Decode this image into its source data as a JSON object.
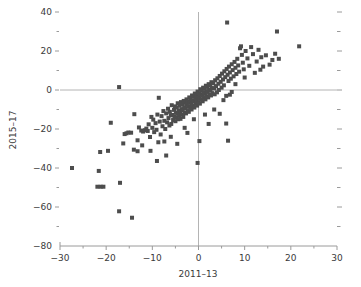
{
  "chart_data": {
    "type": "scatter",
    "title": "",
    "xlabel": "2011–13",
    "ylabel": "2015–17",
    "xlim": [
      -30,
      30
    ],
    "ylim": [
      -80,
      40
    ],
    "x_major_ticks": [
      -30,
      -20,
      -10,
      0,
      10,
      20,
      30
    ],
    "y_major_ticks": [
      40,
      20,
      0,
      -20,
      -40,
      -60,
      -80
    ],
    "x_tick_labels": [
      "−30",
      "−20",
      "−10",
      "0",
      "10",
      "20",
      "30"
    ],
    "y_tick_labels": [
      "40",
      "20",
      "0",
      "−20",
      "−40",
      "−60",
      "−80"
    ],
    "x_minor_ticks": [
      -25,
      -15,
      -5,
      5,
      15,
      25
    ],
    "y_minor_ticks": [
      30,
      10,
      -10,
      -30,
      -50,
      -70
    ],
    "grid": false,
    "zero_lines": true,
    "legend": null,
    "marker": "square",
    "marker_size_px": 4,
    "marker_color": "#4d4d4d",
    "axis_color": "#9a9a9a",
    "zero_line_color": "#b4b4b4",
    "text_color": "#3a3a3a",
    "n_points": 208,
    "points": [
      [
        -27.4,
        -40.0
      ],
      [
        -21.6,
        -41.5
      ],
      [
        -21.9,
        -49.6
      ],
      [
        -21.2,
        -49.6
      ],
      [
        -20.6,
        -49.6
      ],
      [
        -19.0,
        -16.8
      ],
      [
        -21.3,
        -31.8
      ],
      [
        -19.6,
        -31.2
      ],
      [
        -17.2,
        -62.2
      ],
      [
        -17.0,
        -47.6
      ],
      [
        -17.2,
        1.5
      ],
      [
        -16.3,
        -27.4
      ],
      [
        -16.0,
        -22.6
      ],
      [
        -15.6,
        -22.2
      ],
      [
        -15.2,
        -21.8
      ],
      [
        -14.6,
        -21.9
      ],
      [
        -14.4,
        -65.5
      ],
      [
        -14.0,
        -30.6
      ],
      [
        -13.9,
        -12.4
      ],
      [
        -13.2,
        -25.8
      ],
      [
        -12.9,
        -19.2
      ],
      [
        -12.4,
        -20.8
      ],
      [
        -12.0,
        -21.3
      ],
      [
        -11.6,
        -20.6
      ],
      [
        -11.3,
        -19.8
      ],
      [
        -11.0,
        -21.0
      ],
      [
        -10.8,
        -17.6
      ],
      [
        -10.5,
        -24.1
      ],
      [
        -10.4,
        -31.2
      ],
      [
        -10.2,
        -13.8
      ],
      [
        -10.0,
        -19.4
      ],
      [
        -9.8,
        -15.2
      ],
      [
        -9.6,
        -21.6
      ],
      [
        -9.3,
        -17.0
      ],
      [
        -9.1,
        -20.4
      ],
      [
        -8.9,
        -12.6
      ],
      [
        -8.7,
        -26.8
      ],
      [
        -8.6,
        -4.0
      ],
      [
        -8.4,
        -16.2
      ],
      [
        -8.2,
        -22.8
      ],
      [
        -8.0,
        -13.4
      ],
      [
        -7.8,
        -18.6
      ],
      [
        -7.6,
        -10.8
      ],
      [
        -7.4,
        -15.8
      ],
      [
        -7.2,
        -20.0
      ],
      [
        -7.0,
        -12.0
      ],
      [
        -7.0,
        -33.6
      ],
      [
        -6.8,
        -16.6
      ],
      [
        -6.6,
        -9.6
      ],
      [
        -6.5,
        -14.4
      ],
      [
        -6.3,
        -18.2
      ],
      [
        -6.2,
        -11.2
      ],
      [
        -6.0,
        -13.0
      ],
      [
        -5.9,
        -17.4
      ],
      [
        -5.8,
        -7.8
      ],
      [
        -5.6,
        -12.8
      ],
      [
        -5.5,
        -15.4
      ],
      [
        -5.3,
        -10.2
      ],
      [
        -5.2,
        -13.6
      ],
      [
        -5.1,
        -8.4
      ],
      [
        -5.0,
        -16.0
      ],
      [
        -4.9,
        -11.6
      ],
      [
        -4.8,
        -14.2
      ],
      [
        -4.7,
        -9.0
      ],
      [
        -4.6,
        -12.2
      ],
      [
        -4.5,
        -6.8
      ],
      [
        -4.4,
        -15.0
      ],
      [
        -4.3,
        -10.6
      ],
      [
        -4.2,
        -13.2
      ],
      [
        -4.1,
        -8.0
      ],
      [
        -4.0,
        -11.4
      ],
      [
        -3.9,
        -14.8
      ],
      [
        -3.8,
        -6.2
      ],
      [
        -3.7,
        -9.8
      ],
      [
        -3.6,
        -12.6
      ],
      [
        -3.5,
        -7.4
      ],
      [
        -3.4,
        -10.4
      ],
      [
        -3.3,
        -13.8
      ],
      [
        -3.2,
        -5.6
      ],
      [
        -3.1,
        -8.8
      ],
      [
        -3.0,
        -11.8
      ],
      [
        -2.9,
        -6.6
      ],
      [
        -2.8,
        -9.4
      ],
      [
        -2.7,
        -12.0
      ],
      [
        -2.6,
        -4.8
      ],
      [
        -2.5,
        -7.6
      ],
      [
        -2.4,
        -10.8
      ],
      [
        -2.3,
        -5.8
      ],
      [
        -2.2,
        -8.6
      ],
      [
        -2.1,
        -11.2
      ],
      [
        -2.0,
        -3.8
      ],
      [
        -1.9,
        -6.4
      ],
      [
        -1.8,
        -9.2
      ],
      [
        -1.7,
        -4.6
      ],
      [
        -1.6,
        -7.2
      ],
      [
        -1.5,
        -10.0
      ],
      [
        -1.4,
        -2.8
      ],
      [
        -1.3,
        -5.4
      ],
      [
        -1.2,
        -8.2
      ],
      [
        -1.1,
        -3.4
      ],
      [
        -1.0,
        -6.0
      ],
      [
        -0.9,
        -9.0
      ],
      [
        -0.8,
        -1.8
      ],
      [
        -0.7,
        -4.4
      ],
      [
        -0.6,
        -7.0
      ],
      [
        -0.5,
        -2.6
      ],
      [
        -0.4,
        -5.2
      ],
      [
        -0.3,
        -8.0
      ],
      [
        -0.2,
        -0.8
      ],
      [
        -0.1,
        -3.6
      ],
      [
        0.0,
        -6.2
      ],
      [
        0.1,
        -1.6
      ],
      [
        0.2,
        -4.2
      ],
      [
        0.3,
        -7.0
      ],
      [
        0.4,
        0.4
      ],
      [
        0.5,
        -2.4
      ],
      [
        0.6,
        -5.0
      ],
      [
        0.7,
        -0.4
      ],
      [
        0.8,
        -3.0
      ],
      [
        0.9,
        -5.8
      ],
      [
        1.0,
        1.2
      ],
      [
        1.1,
        -1.4
      ],
      [
        1.2,
        -4.0
      ],
      [
        1.3,
        0.6
      ],
      [
        1.4,
        -2.0
      ],
      [
        1.5,
        -4.8
      ],
      [
        1.6,
        2.2
      ],
      [
        1.7,
        -0.6
      ],
      [
        1.8,
        -3.2
      ],
      [
        1.9,
        1.6
      ],
      [
        2.0,
        -1.0
      ],
      [
        2.1,
        -3.8
      ],
      [
        2.2,
        3.0
      ],
      [
        2.3,
        0.2
      ],
      [
        2.4,
        -2.4
      ],
      [
        2.5,
        2.4
      ],
      [
        2.6,
        -0.2
      ],
      [
        2.7,
        -2.8
      ],
      [
        2.8,
        4.0
      ],
      [
        2.9,
        1.0
      ],
      [
        3.0,
        -1.6
      ],
      [
        3.2,
        3.4
      ],
      [
        3.4,
        0.8
      ],
      [
        3.5,
        -2.2
      ],
      [
        3.6,
        5.0
      ],
      [
        3.8,
        2.0
      ],
      [
        4.0,
        -1.2
      ],
      [
        4.1,
        6.0
      ],
      [
        4.3,
        3.2
      ],
      [
        4.4,
        0.0
      ],
      [
        4.6,
        7.2
      ],
      [
        4.8,
        4.2
      ],
      [
        5.0,
        1.2
      ],
      [
        5.1,
        8.4
      ],
      [
        5.3,
        5.4
      ],
      [
        5.5,
        2.4
      ],
      [
        5.6,
        9.6
      ],
      [
        5.8,
        6.6
      ],
      [
        6.0,
        -3.0
      ],
      [
        6.1,
        10.8
      ],
      [
        6.3,
        7.8
      ],
      [
        6.5,
        4.6
      ],
      [
        6.6,
        12.0
      ],
      [
        6.8,
        9.0
      ],
      [
        7.0,
        5.8
      ],
      [
        7.2,
        13.2
      ],
      [
        7.4,
        10.2
      ],
      [
        7.6,
        7.0
      ],
      [
        7.8,
        14.4
      ],
      [
        8.0,
        11.4
      ],
      [
        8.2,
        8.2
      ],
      [
        8.4,
        16.0
      ],
      [
        8.6,
        12.6
      ],
      [
        8.8,
        9.4
      ],
      [
        9.0,
        21.4
      ],
      [
        9.2,
        22.4
      ],
      [
        9.4,
        18.0
      ],
      [
        9.6,
        14.0
      ],
      [
        9.8,
        10.6
      ],
      [
        10.2,
        20.0
      ],
      [
        10.6,
        16.2
      ],
      [
        11.0,
        12.4
      ],
      [
        11.4,
        22.0
      ],
      [
        11.8,
        18.4
      ],
      [
        12.2,
        8.8
      ],
      [
        12.6,
        14.6
      ],
      [
        13.0,
        20.6
      ],
      [
        13.6,
        16.8
      ],
      [
        14.0,
        12.0
      ],
      [
        14.6,
        17.8
      ],
      [
        15.4,
        13.0
      ],
      [
        16.0,
        15.4
      ],
      [
        16.6,
        18.6
      ],
      [
        17.0,
        30.0
      ],
      [
        17.4,
        16.0
      ],
      [
        21.8,
        22.4
      ],
      [
        6.2,
        34.6
      ],
      [
        6.4,
        -26.0
      ],
      [
        6.0,
        -17.2
      ],
      [
        0.2,
        -26.2
      ],
      [
        -0.2,
        -37.4
      ],
      [
        2.2,
        -17.4
      ],
      [
        4.6,
        -12.2
      ],
      [
        3.4,
        -10.0
      ],
      [
        1.4,
        -12.6
      ],
      [
        -4.6,
        -27.6
      ],
      [
        -7.4,
        -26.4
      ],
      [
        -9.0,
        -36.4
      ],
      [
        -12.2,
        -28.4
      ],
      [
        -13.2,
        -31.4
      ],
      [
        -3.0,
        -19.4
      ],
      [
        -1.0,
        -15.0
      ],
      [
        5.4,
        -5.2
      ],
      [
        6.8,
        -2.4
      ],
      [
        7.2,
        -1.0
      ],
      [
        13.4,
        10.4
      ],
      [
        10.0,
        6.4
      ],
      [
        8.0,
        3.0
      ],
      [
        -6.0,
        -24.0
      ],
      [
        -2.4,
        -22.0
      ]
    ]
  }
}
